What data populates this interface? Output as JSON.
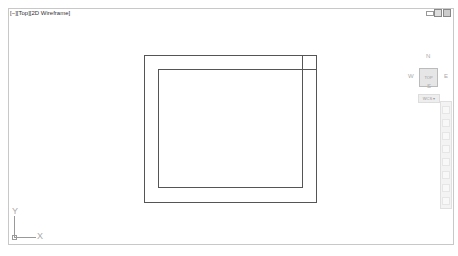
{
  "viewport": {
    "label": "[−][Top][2D Wireframe]"
  },
  "window_controls": {
    "minimize": "minimize-icon",
    "restore": "restore-icon",
    "close": "close-icon"
  },
  "viewcube": {
    "north": "N",
    "south": "S",
    "east": "E",
    "west": "W",
    "face": "TOP",
    "wcs_label": "WCS ▾"
  },
  "navbar": {
    "tools": [
      "steering-wheel",
      "pan",
      "zoom-extents",
      "orbit",
      "showmotion",
      "look",
      "walk",
      "fly",
      "center"
    ]
  },
  "ucs": {
    "x_label": "X",
    "y_label": "Y"
  },
  "drawing": {
    "outer_rect": [
      144,
      55,
      316,
      202
    ],
    "inner_rect": [
      158,
      69,
      302,
      187
    ],
    "line_color": "#555555"
  }
}
